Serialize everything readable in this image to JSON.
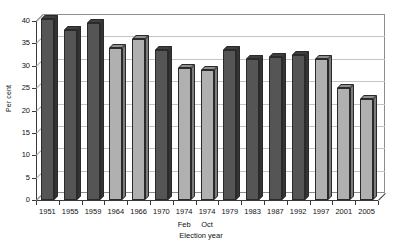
{
  "chart_data": {
    "type": "bar",
    "title": "",
    "xlabel": "Election year",
    "ylabel": "Per cent",
    "ylim": [
      0,
      40
    ],
    "ytick_labels": [
      "0",
      "5",
      "10",
      "15",
      "20",
      "25",
      "30",
      "35",
      "40"
    ],
    "ytick_values": [
      0,
      5,
      10,
      15,
      20,
      25,
      30,
      35,
      40
    ],
    "grid": true,
    "legend": "none",
    "categories": [
      "1951",
      "1955",
      "1959",
      "1964",
      "1966",
      "1970",
      "1974",
      "1974",
      "1979",
      "1983",
      "1987",
      "1992",
      "1997",
      "2001",
      "2005"
    ],
    "category_sublabels": [
      "",
      "",
      "",
      "",
      "",
      "",
      "Feb",
      "Oct",
      "",
      "",
      "",
      "",
      "",
      "",
      ""
    ],
    "values": [
      40.5,
      38.0,
      39.5,
      34.0,
      36.0,
      33.5,
      29.5,
      29.0,
      33.5,
      31.5,
      32.0,
      32.5,
      31.5,
      25.0,
      22.5
    ],
    "bar_shades": [
      "dark",
      "dark",
      "dark",
      "light",
      "light",
      "dark",
      "light",
      "light",
      "dark",
      "dark",
      "dark",
      "dark",
      "light",
      "light",
      "light"
    ]
  },
  "colors": {
    "bar_dark": "#555555",
    "bar_light": "#b0b0b0",
    "bar_dark_top": "#3f3f3f",
    "bar_light_top": "#8f8f8f",
    "bar_dark_side": "#343434",
    "bar_light_side": "#7c7c7c",
    "axis": "#3a3a3a",
    "grid": "#c4c4c4",
    "background": "#ffffff"
  }
}
